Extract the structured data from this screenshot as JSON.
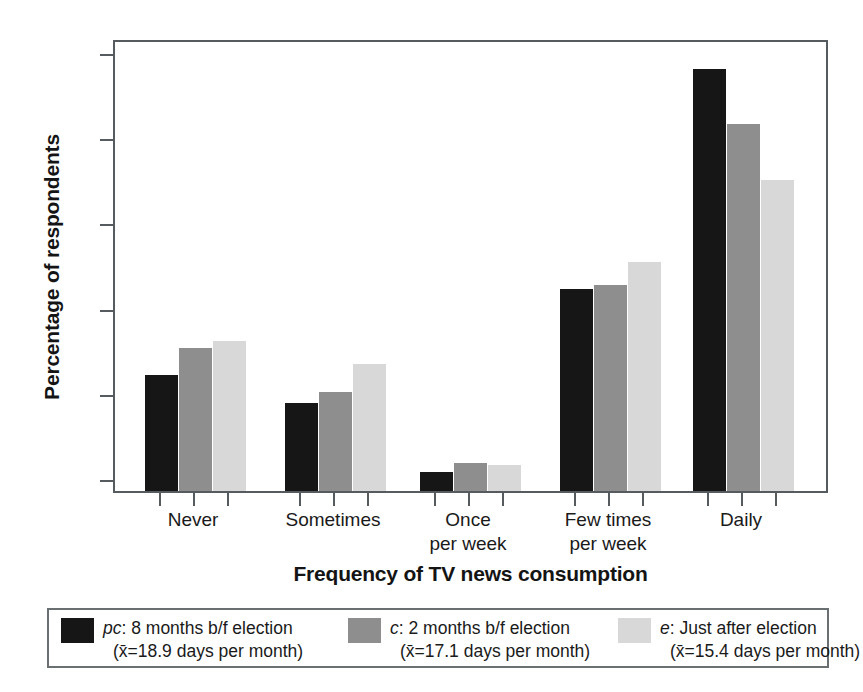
{
  "chart_data": {
    "type": "bar",
    "title": "",
    "xlabel": "Frequency of TV news consumption",
    "ylabel": "Percentage of respondents",
    "categories": [
      "Never",
      "Sometimes",
      "Once\nper week",
      "Few times\nper week",
      "Daily"
    ],
    "category_lines": [
      [
        "Never"
      ],
      [
        "Sometimes"
      ],
      [
        "Once",
        "per week"
      ],
      [
        "Few times",
        "per week"
      ],
      [
        "Daily"
      ]
    ],
    "series": [
      {
        "name": "pc: 8 months b/f election",
        "key": "pc",
        "color": "#161616",
        "values": [
          13.6,
          10.3,
          2.2,
          23.7,
          49.5
        ]
      },
      {
        "name": "c: 2 months b/f election",
        "key": "c",
        "color": "#8e8e8e",
        "values": [
          16.8,
          11.6,
          3.3,
          24.2,
          43.1
        ]
      },
      {
        "name": "e: Just after election",
        "key": "e",
        "color": "#d8d8d8",
        "values": [
          17.6,
          14.9,
          3.0,
          26.9,
          36.5
        ]
      }
    ],
    "ylim": [
      0,
      50
    ],
    "yticks": [
      0,
      10,
      20,
      30,
      40,
      50
    ],
    "ytick_labels": [
      "0%",
      "10%",
      "20%",
      "30%",
      "40%",
      "50%"
    ],
    "grid": false,
    "legend_position": "below"
  },
  "axes": {
    "y_title": "Percentage of respondents",
    "x_title": "Frequency of TV news consumption",
    "y_ticks": [
      {
        "value": 50,
        "label": "50%"
      },
      {
        "value": 40,
        "label": "40%"
      },
      {
        "value": 30,
        "label": "30%"
      },
      {
        "value": 20,
        "label": "20%"
      },
      {
        "value": 10,
        "label": "10%"
      },
      {
        "value": 0,
        "label": "0%"
      }
    ],
    "x_categories": [
      {
        "line1": "Never",
        "line2": ""
      },
      {
        "line1": "Sometimes",
        "line2": ""
      },
      {
        "line1": "Once",
        "line2": "per week"
      },
      {
        "line1": "Few times",
        "line2": "per week"
      },
      {
        "line1": "Daily",
        "line2": ""
      }
    ]
  },
  "legend": {
    "items": [
      {
        "key": "pc",
        "prefix": "pc",
        "label": "pc: 8 months b/f election",
        "line1_rest": ": 8 months b/f election",
        "line2": "(x̄=18.9 days per month)",
        "mean_days": 18.9,
        "color": "#161616"
      },
      {
        "key": "c",
        "prefix": "c",
        "label": "c: 2 months b/f election",
        "line1_rest": ": 2 months b/f election",
        "line2": "(x̄=17.1 days per month)",
        "mean_days": 17.1,
        "color": "#8e8e8e"
      },
      {
        "key": "e",
        "prefix": "e",
        "label": "e: Just after election",
        "line1_rest": ": Just after election",
        "line2": "(x̄=15.4 days per month)",
        "mean_days": 15.4,
        "color": "#d8d8d8"
      }
    ]
  },
  "colors": {
    "series_pc": "#161616",
    "series_c": "#8e8e8e",
    "series_e": "#d8d8d8",
    "axis": "#555b5e",
    "text": "#1a1a1a",
    "background": "#ffffff"
  }
}
